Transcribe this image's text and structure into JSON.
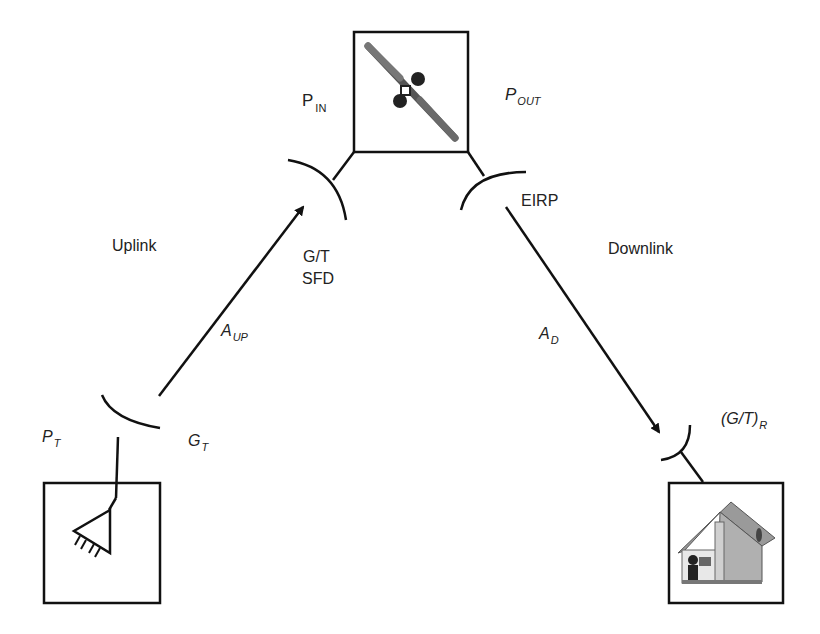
{
  "diagram": {
    "type": "satellite-link-budget",
    "nodes": {
      "satellite": {
        "icon": "satellite-icon",
        "input_power": {
          "main": "P",
          "sub": "IN"
        },
        "output_power": {
          "main": "P",
          "sub": "OUT"
        },
        "gt_label": "G/T",
        "sfd_label": "SFD",
        "eirp_label": "EIRP"
      },
      "transmitter": {
        "icon": "transmitter-amplifier-icon",
        "power": {
          "main": "P",
          "sub": "T"
        },
        "gain": {
          "main": "G",
          "sub": "T"
        }
      },
      "receiver": {
        "icon": "house-icon",
        "gt": {
          "main": "(G/T)",
          "sub": "R"
        }
      }
    },
    "links": {
      "uplink": {
        "label": "Uplink",
        "attenuation": {
          "main": "A",
          "sub": "UP"
        }
      },
      "downlink": {
        "label": "Downlink",
        "attenuation": {
          "main": "A",
          "sub": "D"
        }
      }
    },
    "colors": {
      "line": "#111111",
      "roof": "#9a9a9a",
      "wall": "#bdbdbd"
    }
  }
}
